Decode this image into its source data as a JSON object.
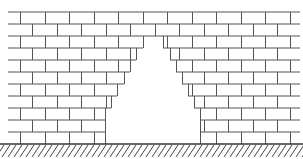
{
  "diagram": {
    "title": "",
    "colors": {
      "background": "#ffffff",
      "mortar_line": "#555555",
      "ground_line": "#333333",
      "hatch": "#444444"
    },
    "wall": {
      "left": 8,
      "right": 300,
      "top": 12,
      "row_height": 12,
      "rows": 11,
      "brick_length": 24.5,
      "course_offset": 12
    },
    "opening": {
      "apex_row": 2,
      "left_edges": [
        143,
        136,
        130,
        124,
        117,
        111,
        105,
        105,
        105
      ],
      "right_edges": [
        163,
        170,
        176,
        182,
        188,
        194,
        200,
        200,
        200
      ]
    },
    "ground": {
      "y": 144,
      "hatch_spacing": 6
    },
    "labels": []
  }
}
